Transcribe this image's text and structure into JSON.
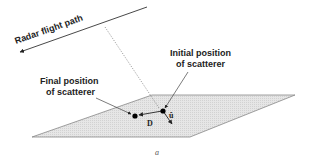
{
  "figure": {
    "caption": "a",
    "flight_path_label": "Radar flight path",
    "initial_position_label_line1": "Initial position",
    "initial_position_label_line2": "of scatterer",
    "final_position_label_line1": "Final position",
    "final_position_label_line2": "of scatterer",
    "displacement_vector_label": "D",
    "unit_vector_label": "û"
  },
  "colors": {
    "ground_plane_fill": "#e4e4e4",
    "ground_plane_stroke": "#888888",
    "line": "#333333",
    "dotted_line": "#777777",
    "scatterer": "#000000"
  }
}
